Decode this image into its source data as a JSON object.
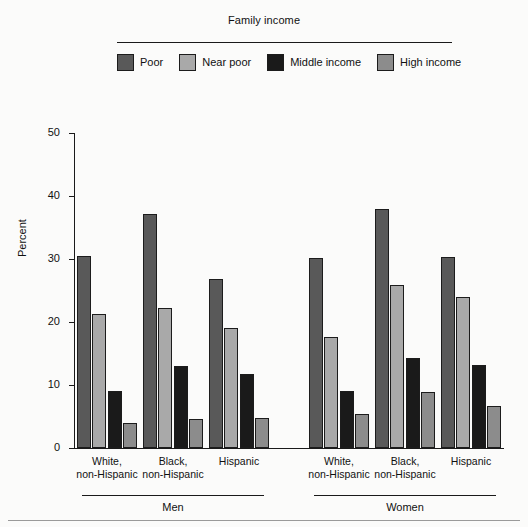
{
  "legend": {
    "title": "Family income",
    "items": [
      {
        "label": "Poor",
        "color": "#595959",
        "icon": "legend-swatch-poor"
      },
      {
        "label": "Near poor",
        "color": "#a9a9a9",
        "icon": "legend-swatch-near-poor"
      },
      {
        "label": "Middle income",
        "color": "#1a1a1a",
        "icon": "legend-swatch-middle-income"
      },
      {
        "label": "High income",
        "color": "#8c8c8c",
        "icon": "legend-swatch-high-income"
      }
    ]
  },
  "axis": {
    "ylabel": "Percent",
    "yticks": [
      "0",
      "10",
      "20",
      "30",
      "40",
      "50"
    ]
  },
  "groups": [
    {
      "label": "Men",
      "categories": [
        "White,\nnon-Hispanic",
        "Black,\nnon-Hispanic",
        "Hispanic"
      ]
    },
    {
      "label": "Women",
      "categories": [
        "White,\nnon-Hispanic",
        "Black,\nnon-Hispanic",
        "Hispanic"
      ]
    }
  ],
  "chart_data": {
    "type": "bar",
    "title": "Family income",
    "xlabel": "",
    "ylabel": "Percent",
    "ylim": [
      0,
      50
    ],
    "yticks": [
      0,
      10,
      20,
      30,
      40,
      50
    ],
    "grid": false,
    "legend_position": "top",
    "categories": [
      "Men / White, non-Hispanic",
      "Men / Black, non-Hispanic",
      "Men / Hispanic",
      "Women / White, non-Hispanic",
      "Women / Black, non-Hispanic",
      "Women / Hispanic"
    ],
    "series": [
      {
        "name": "Poor",
        "color": "#595959",
        "values": [
          30.4,
          37.2,
          26.8,
          30.2,
          38.0,
          30.3
        ]
      },
      {
        "name": "Near poor",
        "color": "#a9a9a9",
        "values": [
          21.2,
          22.3,
          19.0,
          17.7,
          25.8,
          24.0
        ]
      },
      {
        "name": "Middle income",
        "color": "#1a1a1a",
        "values": [
          9.0,
          13.0,
          11.7,
          9.0,
          14.3,
          13.1
        ]
      },
      {
        "name": "High income",
        "color": "#8c8c8c",
        "values": [
          4.0,
          4.6,
          4.7,
          5.4,
          8.9,
          6.6
        ]
      }
    ]
  }
}
